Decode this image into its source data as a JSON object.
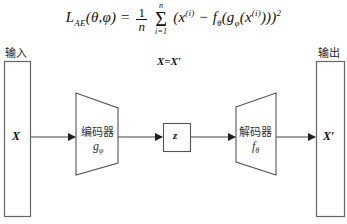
{
  "formula": {
    "lhs": "L",
    "lhs_sub": "AE",
    "args": "(θ,φ) =",
    "frac_num": "1",
    "frac_den": "n",
    "sum_top": "n",
    "sum_bottom": "i=1",
    "sum_symbol": "Σ",
    "body_1": "(x",
    "body_sup_1": "(i)",
    "body_2": " − f",
    "body_sub_theta": "θ",
    "body_3": "(g",
    "body_sub_phi": "φ",
    "body_4": "(x",
    "body_sup_2": "(i)",
    "body_5": ")))",
    "body_sq": "2"
  },
  "diagram": {
    "input_label": "输入",
    "output_label": "输出",
    "equality_label": "X=X′",
    "input_var": "X",
    "output_var": "X′",
    "encoder": {
      "name": "编码器",
      "fn": "g",
      "fn_sub": "φ"
    },
    "latent": {
      "var": "z"
    },
    "decoder": {
      "name": "解码器",
      "fn": "f",
      "fn_sub": "θ"
    }
  },
  "colors": {
    "stroke": "#555555",
    "arrow": "#222222",
    "text": "#111111"
  }
}
